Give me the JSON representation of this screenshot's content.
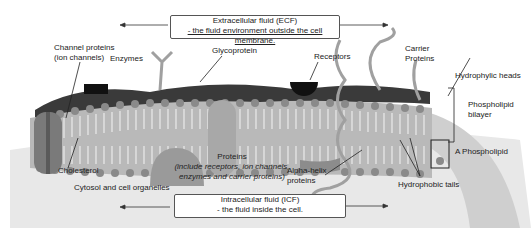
{
  "diagram": {
    "ecf": {
      "line1": "Extracellular fluid (ECF)",
      "line2": "- the fluid environment outside the cell membrane."
    },
    "icf": {
      "line1": "Intracellular fluid (ICF)",
      "line2": "- the fluid inside the cell."
    },
    "labels": {
      "channel_proteins_1": "Channel proteins",
      "channel_proteins_2": "(ion channels)",
      "enzymes": "Enzymes",
      "glycoprotein": "Glycoprotein",
      "receptors": "Receptors",
      "carrier_1": "Carrier",
      "carrier_2": "Proteins",
      "hydrophylic_heads": "Hydrophylic heads",
      "phospholipid_bilayer_1": "Phospholipid",
      "phospholipid_bilayer_2": "bilayer",
      "a_phospholipid": "A Phospholipid",
      "cholesterol": "Cholesterol",
      "proteins": "Proteins",
      "proteins_note_1": "(include receptors, ion channels,",
      "proteins_note_2": "enzymes and carrier proteins)",
      "alpha_helix_1": "Alpha-helix",
      "alpha_helix_2": "proteins",
      "hydrophobic_tails": "Hydrophobic tails",
      "cytosol": "Cytosol and cell organelles"
    },
    "colors": {
      "membrane_dark": "#3a3a3a",
      "head": "#8a8a8a",
      "protein": "#9a9a9a",
      "cytosol": "#e6e6e6",
      "outer_ring": "#cfcfcf"
    }
  }
}
